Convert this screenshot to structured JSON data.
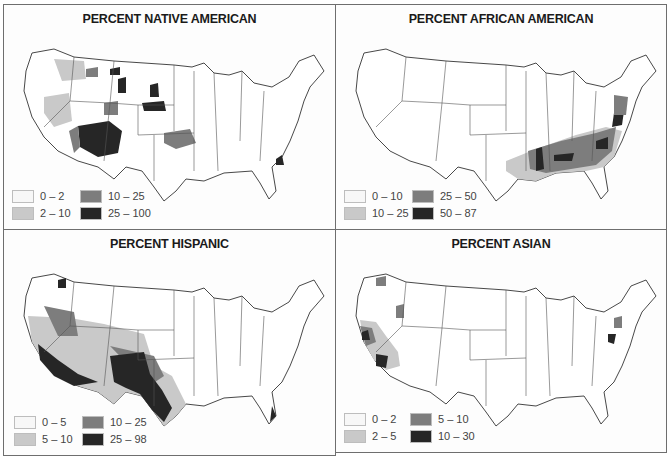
{
  "colors": {
    "class1": "#f7f7f7",
    "class2": "#c9c9c9",
    "class3": "#7d7d7d",
    "class4": "#262626",
    "border": "#6e6e6e"
  },
  "panels": [
    {
      "title": "PERCENT NATIVE AMERICAN",
      "legend": [
        {
          "label": "0 – 2",
          "color": "#f7f7f7"
        },
        {
          "label": "2 – 10",
          "color": "#c9c9c9"
        },
        {
          "label": "10 – 25",
          "color": "#7d7d7d"
        },
        {
          "label": "25 – 100",
          "color": "#262626"
        }
      ]
    },
    {
      "title": "PERCENT AFRICAN AMERICAN",
      "legend": [
        {
          "label": "0 – 10",
          "color": "#f7f7f7"
        },
        {
          "label": "10 – 25",
          "color": "#c9c9c9"
        },
        {
          "label": "25 – 50",
          "color": "#7d7d7d"
        },
        {
          "label": "50 – 87",
          "color": "#262626"
        }
      ]
    },
    {
      "title": "PERCENT HISPANIC",
      "legend": [
        {
          "label": "0 – 5",
          "color": "#f7f7f7"
        },
        {
          "label": "5 – 10",
          "color": "#c9c9c9"
        },
        {
          "label": "10 – 25",
          "color": "#7d7d7d"
        },
        {
          "label": "25 – 98",
          "color": "#262626"
        }
      ]
    },
    {
      "title": "PERCENT ASIAN",
      "legend": [
        {
          "label": "0 – 2",
          "color": "#f7f7f7"
        },
        {
          "label": "2 – 5",
          "color": "#c9c9c9"
        },
        {
          "label": "5 – 10",
          "color": "#7d7d7d"
        },
        {
          "label": "10 – 30",
          "color": "#262626"
        }
      ]
    }
  ]
}
